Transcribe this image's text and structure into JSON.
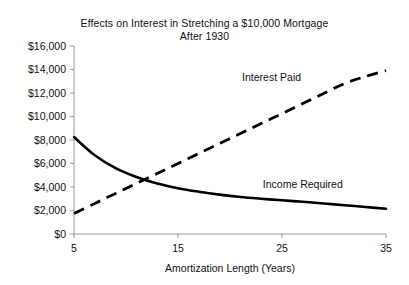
{
  "chart_data": {
    "type": "line",
    "title": "Effects on Interest in Stretching a $10,000 Mortgage After 1930",
    "title_line1": "Effects on Interest in Stretching a $10,000 Mortgage",
    "title_line2": "After 1930",
    "xlabel": "Amortization Length (Years)",
    "ylabel": "",
    "xlim": [
      5,
      35
    ],
    "ylim": [
      0,
      16000
    ],
    "grid": false,
    "legend_position": "inline-annotation",
    "x_ticks": [
      5,
      15,
      25,
      35
    ],
    "x_tick_labels": [
      "5",
      "15",
      "25",
      "35"
    ],
    "y_ticks": [
      0,
      2000,
      4000,
      6000,
      8000,
      10000,
      12000,
      14000,
      16000
    ],
    "y_tick_labels": [
      "$0",
      "$2,000",
      "$4,000",
      "$6,000",
      "$8,000",
      "$10,000",
      "$12,000",
      "$14,000",
      "$16,000"
    ],
    "x": [
      5,
      7,
      9,
      11,
      13,
      15,
      17,
      19,
      21,
      23,
      25,
      27,
      29,
      31,
      33,
      35
    ],
    "series": [
      {
        "name": "Interest Paid",
        "style": "dashed",
        "label_x": 24,
        "label_y": 13000,
        "values": [
          1750,
          2600,
          3450,
          4300,
          5150,
          6000,
          6850,
          7700,
          8550,
          9400,
          10250,
          11100,
          11950,
          12800,
          13400,
          13900
        ]
      },
      {
        "name": "Income Required",
        "style": "solid",
        "label_x": 27,
        "label_y": 3900,
        "values": [
          8250,
          6700,
          5600,
          4850,
          4300,
          3900,
          3600,
          3350,
          3150,
          3000,
          2870,
          2740,
          2600,
          2450,
          2300,
          2150
        ]
      }
    ],
    "annotations": [
      {
        "text": "Interest Paid",
        "x": 24,
        "y": 13000
      },
      {
        "text": "Income Required",
        "x": 27,
        "y": 3900
      }
    ],
    "colors": {
      "series_stroke": "#000000",
      "axis": "#9a9a9a",
      "text": "#111111",
      "background": "#ffffff"
    }
  }
}
